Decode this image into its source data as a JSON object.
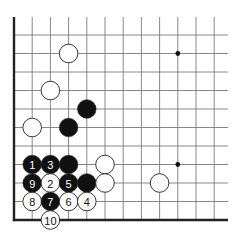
{
  "diagram": {
    "type": "go-board-corner",
    "corner": "bottom-left",
    "grid": {
      "columns": 12,
      "rows": 11,
      "origin_x": 14,
      "origin_y": 220,
      "spacing_x": 18.2,
      "spacing_y": 18.5,
      "extend_right": 228,
      "extend_top": 17
    },
    "colors": {
      "line": "#7a7a7a",
      "edge": "#222222",
      "black": "#111111",
      "white": "#ffffff",
      "stone_outline": "#222222",
      "hoshi": "#111111"
    },
    "hoshi": [
      {
        "col": 9,
        "row": 9
      },
      {
        "col": 9,
        "row": 3
      }
    ],
    "stones": [
      {
        "color": "white",
        "col": 3,
        "row": 9,
        "label": ""
      },
      {
        "color": "white",
        "col": 2,
        "row": 7,
        "label": ""
      },
      {
        "color": "black",
        "col": 4,
        "row": 6,
        "label": ""
      },
      {
        "color": "black",
        "col": 3,
        "row": 5,
        "label": ""
      },
      {
        "color": "white",
        "col": 1,
        "row": 5,
        "label": ""
      },
      {
        "color": "black",
        "col": 1,
        "row": 3,
        "label": "1"
      },
      {
        "color": "black",
        "col": 2,
        "row": 3,
        "label": "3"
      },
      {
        "color": "black",
        "col": 3,
        "row": 3,
        "label": ""
      },
      {
        "color": "white",
        "col": 5,
        "row": 3,
        "label": ""
      },
      {
        "color": "black",
        "col": 1,
        "row": 2,
        "label": "9"
      },
      {
        "color": "white",
        "col": 2,
        "row": 2,
        "label": "2"
      },
      {
        "color": "black",
        "col": 3,
        "row": 2,
        "label": "5"
      },
      {
        "color": "black",
        "col": 4,
        "row": 2,
        "label": ""
      },
      {
        "color": "white",
        "col": 5,
        "row": 2,
        "label": ""
      },
      {
        "color": "white",
        "col": 8,
        "row": 2,
        "label": ""
      },
      {
        "color": "white",
        "col": 1,
        "row": 1,
        "label": "8"
      },
      {
        "color": "black",
        "col": 2,
        "row": 1,
        "label": "7"
      },
      {
        "color": "white",
        "col": 3,
        "row": 1,
        "label": "6"
      },
      {
        "color": "white",
        "col": 4,
        "row": 1,
        "label": "4"
      },
      {
        "color": "white",
        "col": 2,
        "row": 0,
        "label": "10"
      }
    ]
  }
}
